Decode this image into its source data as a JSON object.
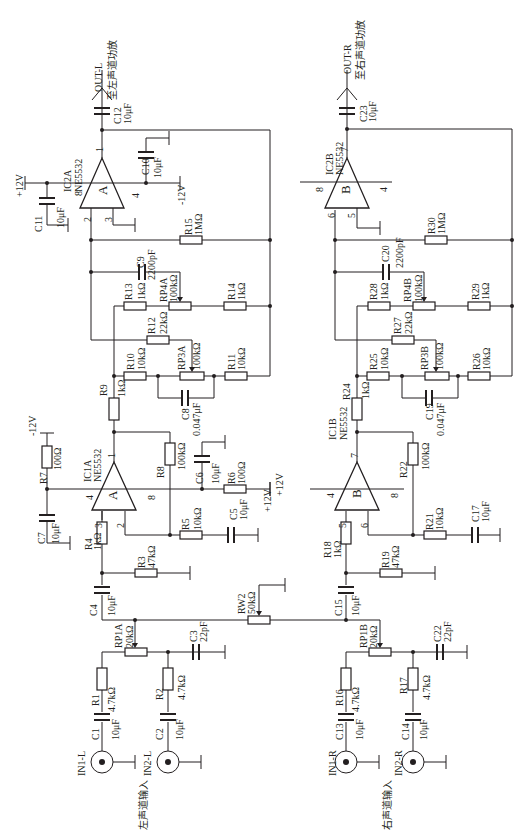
{
  "left_channel": {
    "input_caption": "左声道输入",
    "inputs": [
      {
        "jack": "IN1-L",
        "cap": "C1",
        "cap_value": "10μF",
        "res": "R1",
        "res_value": "4.7kΩ"
      },
      {
        "jack": "IN2-L",
        "cap": "C2",
        "cap_value": "10μF",
        "res": "R2",
        "res_value": "4.7kΩ"
      }
    ],
    "volume_pot": {
      "name": "RP1A",
      "value": "20kΩ"
    },
    "c3": {
      "name": "C3",
      "value": "22pF"
    },
    "c4": {
      "name": "C4",
      "value": "10μF"
    },
    "r3": {
      "name": "R3",
      "value": "47kΩ"
    },
    "r4": {
      "name": "R4",
      "value": "1kΩ"
    },
    "ic1": {
      "name": "IC1A",
      "part": "NE5532",
      "unit": "A",
      "pins": {
        "out": "1",
        "inv": "2",
        "noninv": "3",
        "vneg": "4",
        "vpos": "8"
      }
    },
    "r5": {
      "name": "R5",
      "value": "10kΩ"
    },
    "c5": {
      "name": "C5",
      "value": "10μF"
    },
    "r6": {
      "name": "R6",
      "value": "100Ω"
    },
    "c6": {
      "name": "C6",
      "value": "10μF"
    },
    "r7": {
      "name": "R7",
      "value": "100Ω"
    },
    "c7": {
      "name": "C7",
      "value": "10μF"
    },
    "r8": {
      "name": "R8",
      "value": "100kΩ"
    },
    "supply_pos": "+12V",
    "supply_neg": "-12V",
    "r9": {
      "name": "R9",
      "value": "1kΩ"
    },
    "r10": {
      "name": "R10",
      "value": "10kΩ"
    },
    "rp3": {
      "name": "RP3A",
      "value": "100kΩ"
    },
    "r11": {
      "name": "R11",
      "value": "10kΩ"
    },
    "c8": {
      "name": "C8",
      "value": "0.047μF"
    },
    "r12": {
      "name": "R12",
      "value": "22kΩ"
    },
    "r13": {
      "name": "R13",
      "value": "1kΩ"
    },
    "rp4": {
      "name": "RP4A",
      "value": "100kΩ"
    },
    "r14": {
      "name": "R14",
      "value": "1kΩ"
    },
    "c9": {
      "name": "C9",
      "value": "2200pF"
    },
    "r15": {
      "name": "R15",
      "value": "1MΩ"
    },
    "ic2": {
      "name": "IC2A",
      "part": "NE5532",
      "unit": "A",
      "pins": {
        "out": "1",
        "inv": "2",
        "noninv": "3",
        "vneg": "4",
        "vpos": "8"
      }
    },
    "c10": {
      "name": "C10",
      "value": "10μF"
    },
    "c11": {
      "name": "C11",
      "value": "10μF"
    },
    "c12": {
      "name": "C12",
      "value": "10μF"
    },
    "output": {
      "label": "OUT-L",
      "caption": "至左声道功放"
    }
  },
  "balance_pot": {
    "name": "RW2",
    "value": "50kΩ"
  },
  "right_channel": {
    "input_caption": "右声道输入",
    "inputs": [
      {
        "jack": "IN1-R",
        "cap": "C13",
        "cap_value": "10μF",
        "res": "R16",
        "res_value": "4.7kΩ"
      },
      {
        "jack": "IN2-R",
        "cap": "C14",
        "cap_value": "10μF",
        "res": "R17",
        "res_value": "4.7kΩ"
      }
    ],
    "volume_pot": {
      "name": "RP1B",
      "value": "20kΩ"
    },
    "c22": {
      "name": "C22",
      "value": "22pF"
    },
    "c15": {
      "name": "C15",
      "value": "10μF"
    },
    "r18": {
      "name": "R18",
      "value": "1kΩ"
    },
    "r19": {
      "name": "R19",
      "value": "47kΩ"
    },
    "ic1": {
      "name": "IC1B",
      "part": "NE5532",
      "unit": "B",
      "pins": {
        "out": "7",
        "inv": "6",
        "noninv": "5",
        "vneg": "4",
        "vpos": "8"
      }
    },
    "r21": {
      "name": "R21",
      "value": "10kΩ"
    },
    "c17": {
      "name": "C17",
      "value": "10μF"
    },
    "r22": {
      "name": "R22",
      "value": "100kΩ"
    },
    "supply_pos": "+12V",
    "r24": {
      "name": "R24",
      "value": "1kΩ"
    },
    "r25": {
      "name": "R25",
      "value": "10kΩ"
    },
    "rp3": {
      "name": "RP3B",
      "value": "100kΩ"
    },
    "r26": {
      "name": "R26",
      "value": "10kΩ"
    },
    "c19": {
      "name": "C19",
      "value": "0.047μF"
    },
    "r27": {
      "name": "R27",
      "value": "22kΩ"
    },
    "r28": {
      "name": "R28",
      "value": "1kΩ"
    },
    "rp4": {
      "name": "RP4B",
      "value": "100kΩ"
    },
    "r29": {
      "name": "R29",
      "value": "1kΩ"
    },
    "c20": {
      "name": "C20",
      "value": "2200pF"
    },
    "r30": {
      "name": "R30",
      "value": "1MΩ"
    },
    "ic2": {
      "name": "IC2B",
      "part": "NE5532",
      "unit": "B",
      "pins": {
        "out": "7",
        "inv": "6",
        "noninv": "5",
        "vneg": "4",
        "vpos": "8"
      }
    },
    "c23": {
      "name": "C23",
      "value": "10μF"
    },
    "output": {
      "label": "OUT-R",
      "caption": "至右声道功放"
    }
  }
}
